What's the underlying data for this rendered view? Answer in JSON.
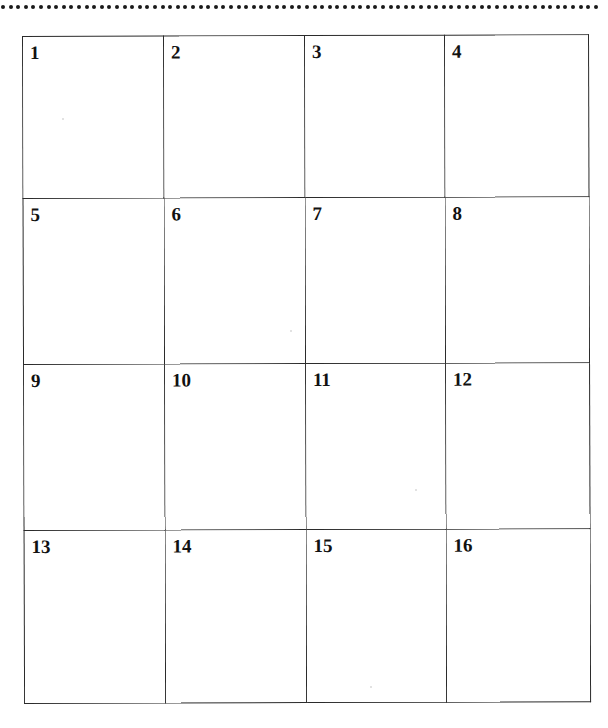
{
  "page": {
    "background_color": "#ffffff",
    "ink_color": "#2b2b2b",
    "text_color": "#111111"
  },
  "top_rule": {
    "style": "dotted",
    "dot_color": "#1a1a1a",
    "dot_diameter_px": 4,
    "dot_spacing_px": 7.6,
    "dot_count": 79,
    "y_px": 6
  },
  "grid": {
    "rows": 4,
    "columns": 4,
    "border_color": "#2b2b2b",
    "cell_background": "#ffffff",
    "left_px": 22,
    "top_px": 36,
    "right_px": 584,
    "bottom_px": 703,
    "column_divider_x_px": [
      162,
      302,
      441
    ],
    "row_divider_y_px": [
      198,
      364,
      530
    ],
    "cells": [
      [
        {
          "label": "1"
        },
        {
          "label": "2"
        },
        {
          "label": "3"
        },
        {
          "label": "4"
        }
      ],
      [
        {
          "label": "5"
        },
        {
          "label": "6"
        },
        {
          "label": "7"
        },
        {
          "label": "8"
        }
      ],
      [
        {
          "label": "9"
        },
        {
          "label": "10"
        },
        {
          "label": "11"
        },
        {
          "label": "12"
        }
      ],
      [
        {
          "label": "13"
        },
        {
          "label": "14"
        },
        {
          "label": "15"
        },
        {
          "label": "16"
        }
      ]
    ]
  }
}
